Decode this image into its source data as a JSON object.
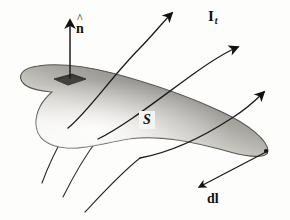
{
  "figure": {
    "kind": "physics-vector-diagram",
    "background_color": "#fdfdfb",
    "ink_color": "#111111",
    "labels": {
      "normal": {
        "hat": "^",
        "symbol": "n"
      },
      "current": {
        "symbol": "I",
        "subscript": "t"
      },
      "surface": "S",
      "line_element": "dl"
    },
    "surface": {
      "name": "S",
      "fill_light": "#f7f6f3",
      "fill_mid": "#b9b7b2",
      "fill_dark": "#6f6d6a",
      "outline_color": "#4a4845"
    },
    "patch": {
      "name": "area-element",
      "fill": "#3a3836"
    },
    "flux_lines": {
      "count": 3,
      "arrow_color": "#1a1a1a",
      "direction": "up-and-to-the-right through the surface"
    },
    "normal_arrow": {
      "color": "#1a1a1a",
      "direction": "up"
    },
    "dl_arrow": {
      "color": "#1a1a1a",
      "direction": "down-left along boundary"
    }
  }
}
